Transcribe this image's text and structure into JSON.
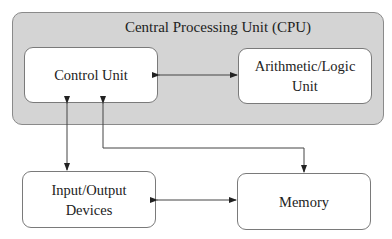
{
  "diagram": {
    "cpu": {
      "title": "Central Processing Unit (CPU)"
    },
    "nodes": {
      "control_unit": {
        "label": "Control Unit"
      },
      "alu": {
        "label_line1": "Arithmetic/Logic",
        "label_line2": "Unit"
      },
      "io": {
        "label_line1": "Input/Output",
        "label_line2": "Devices"
      },
      "memory": {
        "label": "Memory"
      }
    },
    "edges": [
      {
        "from": "Control Unit",
        "to": "Arithmetic/Logic Unit",
        "direction": "bidirectional"
      },
      {
        "from": "Control Unit",
        "to": "Input/Output Devices",
        "direction": "bidirectional"
      },
      {
        "from": "Control Unit",
        "to": "Memory",
        "direction": "bidirectional"
      },
      {
        "from": "Input/Output Devices",
        "to": "Memory",
        "direction": "bidirectional"
      }
    ],
    "colors": {
      "cpu_fill": "#d4d4d4",
      "box_fill": "#ffffff",
      "stroke": "#333333"
    }
  }
}
